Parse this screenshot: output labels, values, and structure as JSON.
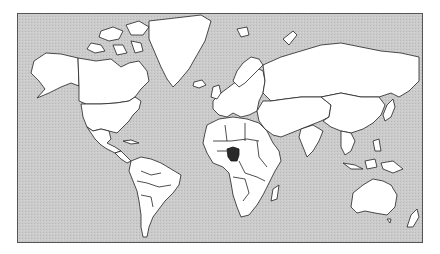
{
  "map": {
    "type": "world-political-outline",
    "projection": "mercator",
    "highlighted_country": "Nigeria",
    "colors": {
      "ocean": "#c9c9c9",
      "land": "#ffffff",
      "border": "#222222",
      "highlight": "#2a2a2a",
      "frame": "#555555"
    }
  }
}
